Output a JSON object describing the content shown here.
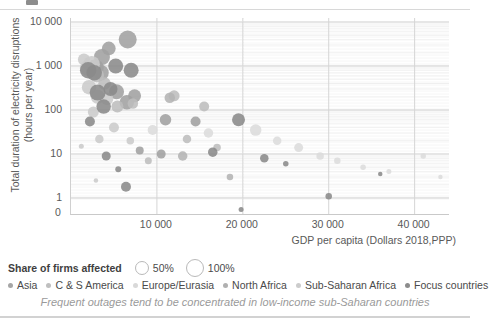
{
  "chart_data": {
    "type": "scatter",
    "subtype": "bubble",
    "title": "",
    "caption": "Frequent outages tend to be concentrated in low-income sub-Saharan countries",
    "xlabel": "GDP per capita (Dollars 2018,PPP)",
    "ylabel": "Total duration of electricity disruptions (hours per year)",
    "ylabel_line1": "Total duration of electricity disruptions",
    "ylabel_line2": "(hours per year)",
    "yscale": "log",
    "ylim": [
      1,
      10000
    ],
    "ytick_labels": [
      "10 000",
      "1 000",
      "100",
      "10",
      "1",
      "0"
    ],
    "ytick_values": [
      10000,
      1000,
      100,
      10,
      1,
      0
    ],
    "xlim": [
      0,
      44000
    ],
    "xtick_labels": [
      "10 000",
      "20 000",
      "30 000",
      "40 000"
    ],
    "xtick_values": [
      10000,
      20000,
      30000,
      40000
    ],
    "grid": true,
    "grid_minor": true,
    "legend_position": "bottom-left",
    "size_legend": {
      "title": "Share of  firms affected",
      "entries": [
        {
          "label": "50%",
          "size": 50
        },
        {
          "label": "100%",
          "size": 100
        }
      ]
    },
    "legend": [
      {
        "name": "Asia",
        "color": "#a6a6a6"
      },
      {
        "name": "C & S America",
        "color": "#bfbfbf"
      },
      {
        "name": "Europe/Eurasia",
        "color": "#d9d9d9"
      },
      {
        "name": "North Africa",
        "color": "#b0b0b0"
      },
      {
        "name": "Sub-Saharan Africa",
        "color": "#cccccc"
      },
      {
        "name": "Focus countries",
        "color": "#8c8c8c"
      }
    ],
    "series": [
      {
        "name": "Asia",
        "color": "#a0a0a0",
        "points": [
          {
            "x": 3600,
            "y": 1600,
            "s": 64
          },
          {
            "x": 4400,
            "y": 2500,
            "s": 55
          },
          {
            "x": 6600,
            "y": 4000,
            "s": 72
          },
          {
            "x": 2800,
            "y": 900,
            "s": 70
          },
          {
            "x": 3500,
            "y": 700,
            "s": 62
          },
          {
            "x": 5300,
            "y": 260,
            "s": 60
          },
          {
            "x": 6500,
            "y": 150,
            "s": 58
          },
          {
            "x": 7400,
            "y": 210,
            "s": 52
          },
          {
            "x": 11000,
            "y": 60,
            "s": 46
          },
          {
            "x": 14500,
            "y": 55,
            "s": 40
          },
          {
            "x": 8000,
            "y": 12,
            "s": 32
          },
          {
            "x": 10500,
            "y": 10,
            "s": 36
          }
        ]
      },
      {
        "name": "C & S America",
        "color": "#bdbdbd",
        "points": [
          {
            "x": 3000,
            "y": 620,
            "s": 58
          },
          {
            "x": 3900,
            "y": 400,
            "s": 50
          },
          {
            "x": 5400,
            "y": 120,
            "s": 48
          },
          {
            "x": 7200,
            "y": 140,
            "s": 42
          },
          {
            "x": 12000,
            "y": 210,
            "s": 44
          },
          {
            "x": 15500,
            "y": 120,
            "s": 40
          },
          {
            "x": 13500,
            "y": 22,
            "s": 34
          },
          {
            "x": 17000,
            "y": 14,
            "s": 30
          },
          {
            "x": 9000,
            "y": 7,
            "s": 28
          }
        ]
      },
      {
        "name": "Europe/Eurasia",
        "color": "#dcdcdc",
        "points": [
          {
            "x": 9500,
            "y": 35,
            "s": 40
          },
          {
            "x": 16000,
            "y": 30,
            "s": 38
          },
          {
            "x": 21500,
            "y": 35,
            "s": 46
          },
          {
            "x": 24000,
            "y": 20,
            "s": 34
          },
          {
            "x": 26500,
            "y": 14,
            "s": 36
          },
          {
            "x": 29000,
            "y": 9,
            "s": 30
          },
          {
            "x": 31000,
            "y": 7,
            "s": 26
          },
          {
            "x": 34000,
            "y": 5,
            "s": 22
          },
          {
            "x": 37000,
            "y": 4,
            "s": 20
          },
          {
            "x": 41000,
            "y": 9,
            "s": 22
          },
          {
            "x": 43000,
            "y": 3,
            "s": 18
          }
        ]
      },
      {
        "name": "North Africa",
        "color": "#b4b4b4",
        "points": [
          {
            "x": 11500,
            "y": 190,
            "s": 42
          },
          {
            "x": 13000,
            "y": 9,
            "s": 38
          },
          {
            "x": 18500,
            "y": 3,
            "s": 26
          }
        ]
      },
      {
        "name": "Sub-Saharan Africa",
        "color": "#cbcbcb",
        "points": [
          {
            "x": 1500,
            "y": 1400,
            "s": 48
          },
          {
            "x": 1900,
            "y": 900,
            "s": 60
          },
          {
            "x": 2400,
            "y": 1100,
            "s": 66
          },
          {
            "x": 2100,
            "y": 330,
            "s": 58
          },
          {
            "x": 3100,
            "y": 200,
            "s": 56
          },
          {
            "x": 4200,
            "y": 180,
            "s": 50
          },
          {
            "x": 2600,
            "y": 90,
            "s": 44
          },
          {
            "x": 5000,
            "y": 40,
            "s": 40
          },
          {
            "x": 3300,
            "y": 22,
            "s": 34
          },
          {
            "x": 6900,
            "y": 20,
            "s": 30
          },
          {
            "x": 1200,
            "y": 15,
            "s": 20
          },
          {
            "x": 2900,
            "y": 2.5,
            "s": 18
          }
        ]
      },
      {
        "name": "Focus countries",
        "color": "#8a8a8a",
        "points": [
          {
            "x": 2000,
            "y": 800,
            "s": 66
          },
          {
            "x": 2700,
            "y": 700,
            "s": 62
          },
          {
            "x": 3100,
            "y": 250,
            "s": 64
          },
          {
            "x": 3800,
            "y": 120,
            "s": 58
          },
          {
            "x": 4600,
            "y": 300,
            "s": 56
          },
          {
            "x": 5200,
            "y": 1000,
            "s": 60
          },
          {
            "x": 7000,
            "y": 800,
            "s": 60
          },
          {
            "x": 2200,
            "y": 55,
            "s": 40
          },
          {
            "x": 4100,
            "y": 9,
            "s": 36
          },
          {
            "x": 6400,
            "y": 1.8,
            "s": 40
          },
          {
            "x": 19500,
            "y": 60,
            "s": 52
          },
          {
            "x": 16500,
            "y": 11,
            "s": 38
          },
          {
            "x": 22500,
            "y": 8,
            "s": 34
          },
          {
            "x": 30000,
            "y": 1.1,
            "s": 26
          },
          {
            "x": 25000,
            "y": 6,
            "s": 22
          },
          {
            "x": 5500,
            "y": 4.5,
            "s": 24
          },
          {
            "x": 19800,
            "y": 0.55,
            "s": 20
          },
          {
            "x": 36000,
            "y": 3.5,
            "s": 18
          }
        ]
      }
    ]
  }
}
